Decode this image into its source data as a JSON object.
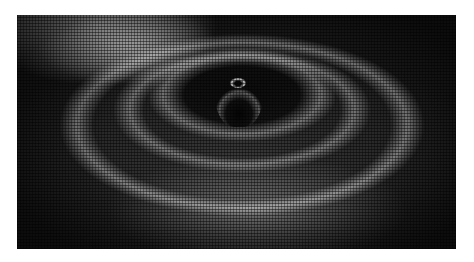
{
  "image": {
    "subject": "3D mesh surface with concentric ripple waves around a central peak",
    "palette": {
      "background": "#ffffff",
      "dark": "#1a1a1a",
      "highlight": "#e6e6e6"
    }
  }
}
